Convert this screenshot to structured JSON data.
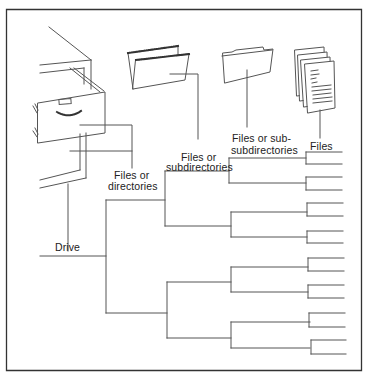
{
  "diagram": {
    "title": "",
    "frame": {
      "x": 6,
      "y": 9,
      "width": 356,
      "height": 362
    },
    "line_color": "#555555",
    "labels": {
      "drive": "Drive",
      "level1_line1": "Files or",
      "level1_line2": "directories",
      "level2_line1": "Files or",
      "level2_line2": "subdirectories",
      "level3_line1": "Files or sub-",
      "level3_line2": "subdirectories",
      "level4": "Files"
    },
    "icons": [
      {
        "name": "file-cabinet-icon",
        "represents": "Drive"
      },
      {
        "name": "hanging-folder-icon",
        "represents": "Files or directories"
      },
      {
        "name": "folder-icon",
        "represents": "Files or subdirectories"
      },
      {
        "name": "document-stack-icon",
        "represents": "Files or sub-subdirectories"
      },
      {
        "name": "pages-icon",
        "represents": "Files"
      }
    ],
    "tree": {
      "label": "Drive",
      "children_count": 2,
      "depth": 4,
      "leaf_count": 16
    }
  }
}
